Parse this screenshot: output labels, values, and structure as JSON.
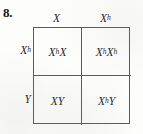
{
  "figure": {
    "problem_number": "8.",
    "type": "punnett-square",
    "grid_line_color": "#5a5a5a",
    "text_color": "#1e1e1e",
    "background_color": "#fdfdfc"
  },
  "punnett": {
    "column_headers": [
      {
        "base": "X",
        "sup": ""
      },
      {
        "base": "X",
        "sup": "h"
      }
    ],
    "row_headers": [
      {
        "base": "X",
        "sup": "h"
      },
      {
        "base": "Y",
        "sup": ""
      }
    ],
    "cells": [
      [
        {
          "parts": [
            {
              "base": "X",
              "sup": "h"
            },
            {
              "base": "X",
              "sup": ""
            }
          ],
          "text": "XhX"
        },
        {
          "parts": [
            {
              "base": "X",
              "sup": "h"
            },
            {
              "base": "X",
              "sup": "h"
            }
          ],
          "text": "XhXh"
        }
      ],
      [
        {
          "parts": [
            {
              "base": "X",
              "sup": ""
            },
            {
              "base": "Y",
              "sup": ""
            }
          ],
          "text": "XY"
        },
        {
          "parts": [
            {
              "base": "X",
              "sup": "h"
            },
            {
              "base": "Y",
              "sup": ""
            }
          ],
          "text": "XhY"
        }
      ]
    ]
  }
}
